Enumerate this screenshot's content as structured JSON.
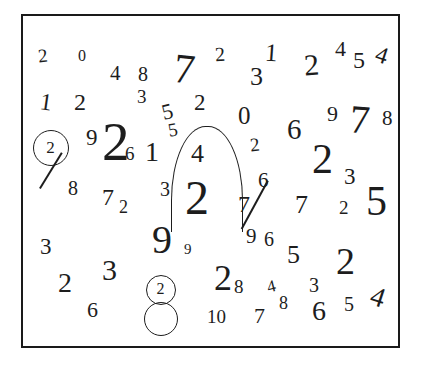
{
  "scene": {
    "title": "scattered-handwritten-digits",
    "background_color": "#ffffff",
    "ink_color": "#1d1d1d",
    "frame": {
      "x": 21,
      "y": 14,
      "w": 379,
      "h": 334,
      "border_color": "#1a1a1a",
      "border_width": 2
    }
  },
  "digits": [
    {
      "value": "2",
      "x": 36,
      "y": 44,
      "size": 19,
      "rot": -6,
      "weight": 400
    },
    {
      "value": "0",
      "x": 76,
      "y": 46,
      "size": 16,
      "rot": 0,
      "weight": 400
    },
    {
      "value": "4",
      "x": 108,
      "y": 61,
      "size": 21,
      "rot": 0,
      "weight": 400
    },
    {
      "value": "8",
      "x": 136,
      "y": 62,
      "size": 20,
      "rot": 0,
      "weight": 400
    },
    {
      "value": "7",
      "x": 172,
      "y": 46,
      "size": 42,
      "rot": 6,
      "weight": 400
    },
    {
      "value": "2",
      "x": 213,
      "y": 42,
      "size": 20,
      "rot": -4,
      "weight": 400
    },
    {
      "value": "1",
      "x": 263,
      "y": 38,
      "size": 25,
      "rot": 4,
      "weight": 400
    },
    {
      "value": "3",
      "x": 248,
      "y": 62,
      "size": 26,
      "rot": 0,
      "weight": 400
    },
    {
      "value": "2",
      "x": 302,
      "y": 48,
      "size": 30,
      "rot": -4,
      "weight": 400
    },
    {
      "value": "4",
      "x": 333,
      "y": 36,
      "size": 22,
      "rot": 0,
      "weight": 400
    },
    {
      "value": "5",
      "x": 351,
      "y": 46,
      "size": 24,
      "rot": 0,
      "weight": 400
    },
    {
      "value": "4",
      "x": 374,
      "y": 41,
      "size": 24,
      "rot": 18,
      "weight": 400
    },
    {
      "value": "1",
      "x": 38,
      "y": 88,
      "size": 24,
      "rot": 8,
      "weight": 400
    },
    {
      "value": "2",
      "x": 72,
      "y": 88,
      "size": 24,
      "rot": 0,
      "weight": 400
    },
    {
      "value": "3",
      "x": 135,
      "y": 85,
      "size": 19,
      "rot": 0,
      "weight": 400
    },
    {
      "value": "5",
      "x": 160,
      "y": 99,
      "size": 22,
      "rot": -14,
      "weight": 400
    },
    {
      "value": "2",
      "x": 192,
      "y": 89,
      "size": 23,
      "rot": 0,
      "weight": 400
    },
    {
      "value": "0",
      "x": 236,
      "y": 101,
      "size": 25,
      "rot": 0,
      "weight": 400
    },
    {
      "value": "6",
      "x": 285,
      "y": 113,
      "size": 29,
      "rot": 0,
      "weight": 400
    },
    {
      "value": "9",
      "x": 325,
      "y": 101,
      "size": 22,
      "rot": 0,
      "weight": 400
    },
    {
      "value": "7",
      "x": 348,
      "y": 98,
      "size": 40,
      "rot": 4,
      "weight": 400
    },
    {
      "value": "8",
      "x": 380,
      "y": 106,
      "size": 21,
      "rot": 0,
      "weight": 400
    },
    {
      "value": "5",
      "x": 166,
      "y": 118,
      "size": 19,
      "rot": -10,
      "weight": 400
    },
    {
      "value": "9",
      "x": 84,
      "y": 124,
      "size": 23,
      "rot": 0,
      "weight": 400
    },
    {
      "value": "2",
      "x": 100,
      "y": 112,
      "size": 55,
      "rot": 0,
      "weight": 400
    },
    {
      "value": "6",
      "x": 123,
      "y": 142,
      "size": 19,
      "rot": 0,
      "weight": 400
    },
    {
      "value": "1",
      "x": 143,
      "y": 136,
      "size": 28,
      "rot": 0,
      "weight": 400
    },
    {
      "value": "4",
      "x": 189,
      "y": 139,
      "size": 26,
      "rot": 0,
      "weight": 400
    },
    {
      "value": "2",
      "x": 248,
      "y": 133,
      "size": 19,
      "rot": -6,
      "weight": 400
    },
    {
      "value": "2",
      "x": 310,
      "y": 136,
      "size": 42,
      "rot": 0,
      "weight": 400
    },
    {
      "value": "3",
      "x": 342,
      "y": 163,
      "size": 23,
      "rot": 0,
      "weight": 400
    },
    {
      "value": "8",
      "x": 66,
      "y": 176,
      "size": 20,
      "rot": 0,
      "weight": 400
    },
    {
      "value": "7",
      "x": 100,
      "y": 183,
      "size": 24,
      "rot": 0,
      "weight": 400
    },
    {
      "value": "2",
      "x": 117,
      "y": 196,
      "size": 18,
      "rot": 0,
      "weight": 400
    },
    {
      "value": "3",
      "x": 158,
      "y": 177,
      "size": 20,
      "rot": 0,
      "weight": 400
    },
    {
      "value": "2",
      "x": 183,
      "y": 172,
      "size": 48,
      "rot": 0,
      "weight": 400
    },
    {
      "value": "6",
      "x": 256,
      "y": 168,
      "size": 21,
      "rot": 0,
      "weight": 400
    },
    {
      "value": "7",
      "x": 236,
      "y": 190,
      "size": 24,
      "rot": 0,
      "weight": 400
    },
    {
      "value": "7",
      "x": 293,
      "y": 190,
      "size": 26,
      "rot": 0,
      "weight": 400
    },
    {
      "value": "2",
      "x": 337,
      "y": 196,
      "size": 19,
      "rot": 0,
      "weight": 400
    },
    {
      "value": "5",
      "x": 364,
      "y": 178,
      "size": 42,
      "rot": 0,
      "weight": 400
    },
    {
      "value": "9",
      "x": 244,
      "y": 224,
      "size": 21,
      "rot": 0,
      "weight": 400
    },
    {
      "value": "6",
      "x": 262,
      "y": 227,
      "size": 20,
      "rot": 0,
      "weight": 400
    },
    {
      "value": "3",
      "x": 38,
      "y": 233,
      "size": 23,
      "rot": 0,
      "weight": 400
    },
    {
      "value": "9",
      "x": 150,
      "y": 218,
      "size": 40,
      "rot": 0,
      "weight": 400
    },
    {
      "value": "9",
      "x": 182,
      "y": 240,
      "size": 15,
      "rot": 0,
      "weight": 400
    },
    {
      "value": "5",
      "x": 285,
      "y": 240,
      "size": 26,
      "rot": 0,
      "weight": 400
    },
    {
      "value": "2",
      "x": 334,
      "y": 240,
      "size": 38,
      "rot": 0,
      "weight": 400
    },
    {
      "value": "2",
      "x": 56,
      "y": 267,
      "size": 28,
      "rot": 0,
      "weight": 400
    },
    {
      "value": "3",
      "x": 100,
      "y": 253,
      "size": 30,
      "rot": 0,
      "weight": 400
    },
    {
      "value": "6",
      "x": 85,
      "y": 297,
      "size": 22,
      "rot": 0,
      "weight": 400
    },
    {
      "value": "2",
      "x": 212,
      "y": 258,
      "size": 36,
      "rot": 0,
      "weight": 400
    },
    {
      "value": "8",
      "x": 232,
      "y": 275,
      "size": 19,
      "rot": 0,
      "weight": 400
    },
    {
      "value": "4",
      "x": 265,
      "y": 276,
      "size": 17,
      "rot": -14,
      "weight": 400
    },
    {
      "value": "3",
      "x": 307,
      "y": 273,
      "size": 20,
      "rot": 0,
      "weight": 400
    },
    {
      "value": "4",
      "x": 369,
      "y": 281,
      "size": 28,
      "rot": 18,
      "weight": 400
    },
    {
      "value": "10",
      "x": 205,
      "y": 305,
      "size": 19,
      "rot": 0,
      "weight": 400
    },
    {
      "value": "7",
      "x": 252,
      "y": 303,
      "size": 22,
      "rot": 0,
      "weight": 400
    },
    {
      "value": "8",
      "x": 277,
      "y": 292,
      "size": 18,
      "rot": 0,
      "weight": 400
    },
    {
      "value": "6",
      "x": 310,
      "y": 295,
      "size": 28,
      "rot": 0,
      "weight": 400
    },
    {
      "value": "5",
      "x": 342,
      "y": 292,
      "size": 20,
      "rot": 0,
      "weight": 400
    }
  ],
  "circled_targets": [
    {
      "label": "2",
      "cx": 49,
      "cy": 146,
      "r": 18,
      "size": 17
    },
    {
      "label": "2",
      "cx": 159,
      "cy": 288,
      "r": 15,
      "size": 16
    }
  ],
  "empty_circles": [
    {
      "cx": 159,
      "cy": 317,
      "r": 17
    }
  ],
  "strokes": [
    {
      "name": "slash-through-circled-two",
      "x1": 60,
      "y1": 150,
      "x2": 38,
      "y2": 186
    },
    {
      "name": "long-diagonal-seven-tail",
      "x1": 266,
      "y1": 178,
      "x2": 240,
      "y2": 226
    }
  ],
  "arch": {
    "name": "large-arch-curve",
    "x": 169,
    "y": 124,
    "w": 72,
    "h": 106
  }
}
